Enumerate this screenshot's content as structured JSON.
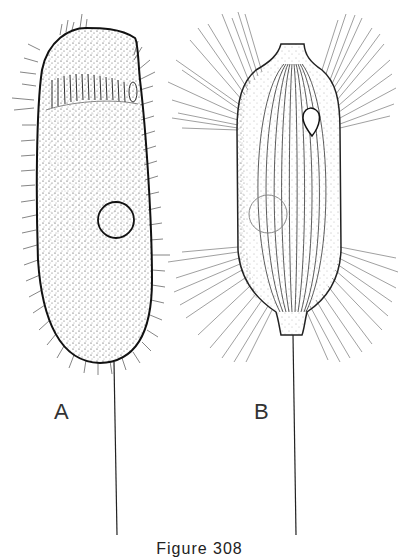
{
  "figure": {
    "panels": [
      {
        "id": "A",
        "label": "A",
        "description": "elongated, densely stippled ciliate with short cilia, oral region at top, round nucleus, long caudal filament"
      },
      {
        "id": "B",
        "label": "B",
        "description": "barrel-shaped ciliate with longitudinal striations, long radiating cilia bands at anterior and posterior, pear-shaped vacuole, faint round nucleus, long caudal filament"
      }
    ],
    "caption": "Figure 308"
  },
  "colors": {
    "ink": "#222222",
    "background": "#ffffff",
    "light_ink": "#777777"
  }
}
